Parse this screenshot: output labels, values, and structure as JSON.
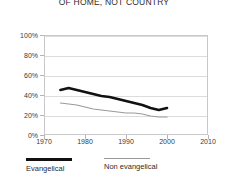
{
  "chart_data": {
    "type": "line",
    "title": "OF HOME, NOT COUNTRY",
    "xlabel": "",
    "ylabel": "",
    "xlim": [
      1970,
      2010
    ],
    "ylim": [
      0,
      100
    ],
    "grid": true,
    "legend_position": "bottom-left",
    "xticks": [
      "1970",
      "1980",
      "1990",
      "2000",
      "2010"
    ],
    "xtick_values": [
      1970,
      1980,
      1990,
      2000,
      2010
    ],
    "yticks": [
      "0%",
      "20%",
      "40%",
      "60%",
      "80%",
      "100%"
    ],
    "ytick_values": [
      0,
      20,
      40,
      60,
      80,
      100
    ],
    "series": [
      {
        "name": "Evangelical",
        "color": "#111111",
        "width": 2.6,
        "x": [
          1974,
          1976,
          1978,
          1980,
          1982,
          1984,
          1986,
          1988,
          1990,
          1992,
          1994,
          1996,
          1998,
          2000
        ],
        "values": [
          45,
          47,
          45,
          43,
          41,
          39,
          38,
          36,
          34,
          32,
          30,
          27,
          25,
          27
        ]
      },
      {
        "name": "Non evangelical",
        "color": "#9a9a9a",
        "width": 1.2,
        "x": [
          1974,
          1976,
          1978,
          1980,
          1982,
          1984,
          1986,
          1988,
          1990,
          1992,
          1994,
          1996,
          1998,
          2000
        ],
        "values": [
          32,
          31,
          30,
          28,
          26,
          25,
          24,
          23,
          22,
          22,
          21,
          19,
          18,
          18
        ]
      }
    ]
  },
  "legend": {
    "items": [
      {
        "label": "Evangelical",
        "color": "#111111",
        "thickness": "2.6px"
      },
      {
        "label": "Non evangelical",
        "color": "#9a9a9a",
        "thickness": "1.2px"
      }
    ]
  }
}
